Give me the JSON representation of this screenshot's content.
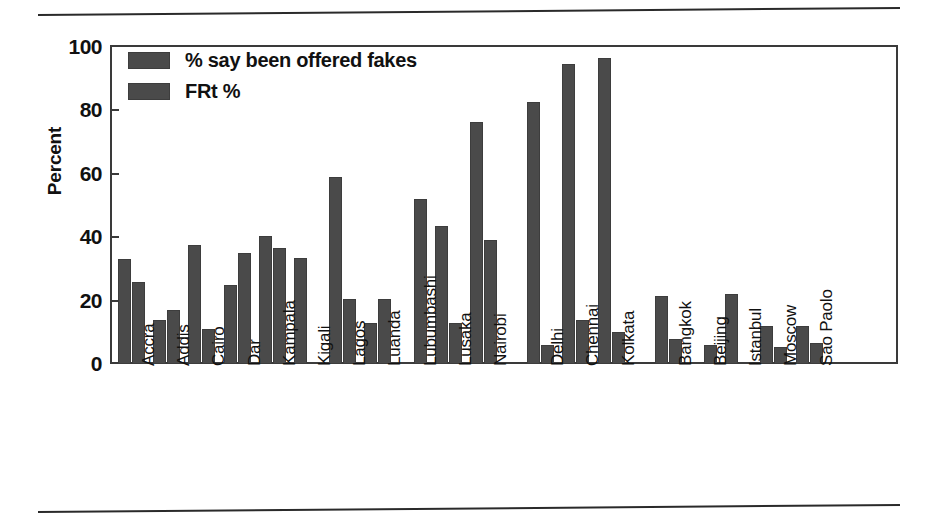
{
  "chart_data": {
    "type": "bar",
    "title": "",
    "xlabel": "",
    "ylabel": "Percent",
    "ylim": [
      0,
      100
    ],
    "yticks": [
      0,
      20,
      40,
      60,
      80,
      100
    ],
    "grid": false,
    "legend_position": "top-left",
    "categories": [
      "Accra",
      "Addis",
      "Cairo",
      "Dar",
      "Kampala",
      "Kigali",
      "Lagos",
      "Luanda",
      "Lubumbashi",
      "Lusaka",
      "Nairobi",
      "Delhi",
      "Chennai",
      "Kolkata",
      "Bangkok",
      "Beijing",
      "Istanbul",
      "Moscow",
      "Sao Paolo"
    ],
    "series": [
      {
        "name": "% say been offered fakes",
        "color": "#4a4a4a",
        "values": [
          33,
          14,
          37.5,
          25,
          40.5,
          33.5,
          59,
          13,
          0,
          43.5,
          76.5,
          82.5,
          94.5,
          96.5,
          21.5,
          0,
          22,
          12,
          12
        ]
      },
      {
        "name": "FRt %",
        "color": "#4a4a4a",
        "values": [
          26,
          17,
          11,
          35,
          36.5,
          0,
          20.5,
          20.5,
          52,
          13,
          39,
          6,
          14,
          10,
          8,
          6,
          0,
          5.5,
          6.5
        ]
      }
    ],
    "group_gaps_after": [
      "Nairobi",
      "Kolkata"
    ]
  },
  "legend": {
    "items": [
      {
        "label": "% say been offered fakes",
        "swatch_color": "#4a4a4a"
      },
      {
        "label": "FRt %",
        "swatch_color": "#4a4a4a"
      }
    ]
  },
  "axis": {
    "y_title": "Percent",
    "y_tick_labels": [
      "100",
      "80",
      "60",
      "40",
      "20",
      "0"
    ]
  }
}
